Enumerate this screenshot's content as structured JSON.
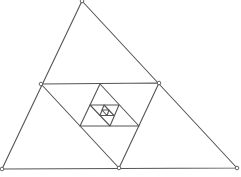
{
  "diagram": {
    "stroke_color": "#555555",
    "stroke_width": 1.1,
    "vertex_fill": "#ffffff",
    "triangles": [
      {
        "level": 1,
        "points": [
          [
            82,
            1
          ],
          [
            2,
            169
          ],
          [
            237,
            168
          ]
        ]
      },
      {
        "level": 2,
        "points": [
          [
            41,
            84
          ],
          [
            159,
            83
          ],
          [
            119,
            168
          ]
        ]
      },
      {
        "level": 3,
        "points": [
          [
            100,
            84
          ],
          [
            80,
            126
          ],
          [
            139,
            126
          ]
        ]
      },
      {
        "level": 4,
        "points": [
          [
            90,
            105
          ],
          [
            119,
            105
          ],
          [
            110,
            126
          ]
        ]
      },
      {
        "level": 5,
        "points": [
          [
            104,
            105
          ],
          [
            114,
            115.5
          ],
          [
            100,
            115.5
          ]
        ]
      },
      {
        "level": 6,
        "points": [
          [
            109,
            110
          ],
          [
            107,
            115.5
          ],
          [
            102,
            110
          ]
        ]
      }
    ],
    "marked_vertices": [
      [
        82,
        1
      ],
      [
        2,
        169
      ],
      [
        237,
        168
      ],
      [
        41,
        84
      ],
      [
        159,
        83
      ],
      [
        119,
        168
      ]
    ]
  }
}
